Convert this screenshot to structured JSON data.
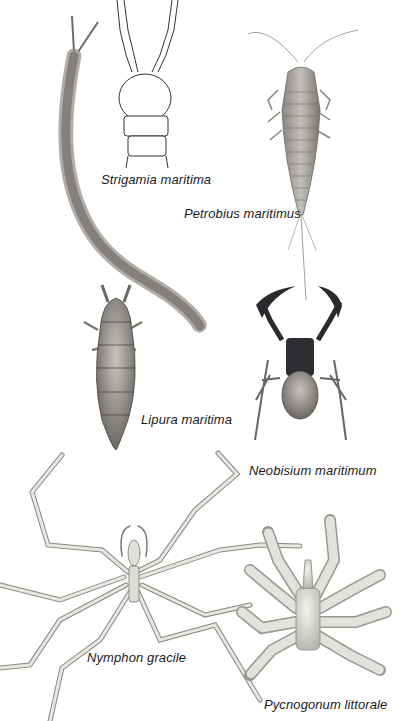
{
  "plate": {
    "background": "#ffffff",
    "specimens": [
      {
        "id": "strigamia",
        "label": "Strigamia maritima",
        "x": 101,
        "y": 172
      },
      {
        "id": "petrobius",
        "label": "Petrobius maritimus",
        "x": 184,
        "y": 206
      },
      {
        "id": "lipura",
        "label": "Lipura maritima",
        "x": 141,
        "y": 412
      },
      {
        "id": "neobisium",
        "label": "Neobisium maritimum",
        "x": 249,
        "y": 463
      },
      {
        "id": "nymphon",
        "label": "Nymphon gracile",
        "x": 87,
        "y": 650
      },
      {
        "id": "pycnogonum",
        "label": "Pycnogonum littorale",
        "x": 264,
        "y": 697
      }
    ],
    "colors": {
      "ink": "#1a1a1a",
      "centipede": "#6e6a66",
      "silverfish": "#a9a6a0",
      "springtail": "#7c7975",
      "pseudoscorpion_dark": "#2a2a2e",
      "pseudoscorpion_body": "#9a9690",
      "sea_spider_leg": "#d8d6d0",
      "sea_spider_outline": "#8a8882",
      "pycnogonum_fill": "#e2e0da"
    }
  }
}
